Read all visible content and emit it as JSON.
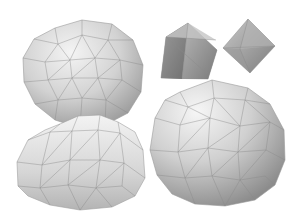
{
  "figure": {
    "background": "#ffffff",
    "objects": [
      {
        "name": "geodesic-sphere-large-left",
        "shape": "geodesic sphere",
        "cx": 82,
        "cy": 72,
        "r": 61
      },
      {
        "name": "geodesic-dome",
        "shape": "geodesic hemisphere",
        "cx": 80,
        "cy": 160
      },
      {
        "name": "pyramid",
        "shape": "square pyramid",
        "cx": 188,
        "cy": 50
      },
      {
        "name": "octahedron",
        "shape": "octahedron",
        "cx": 248,
        "cy": 46
      },
      {
        "name": "geodesic-sphere-large-right",
        "shape": "geodesic sphere",
        "cx": 218,
        "cy": 142,
        "r": 66
      }
    ],
    "shading": {
      "light": "#f2f2f2",
      "mid": "#c8c8c8",
      "dark": "#8f8f8f",
      "edge": "#8a8a8a"
    }
  }
}
